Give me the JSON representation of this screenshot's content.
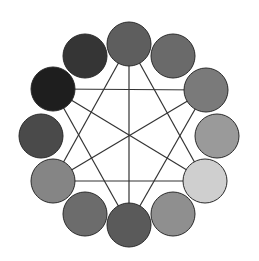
{
  "diagram": {
    "type": "color-wheel-grayscale",
    "width": 259,
    "height": 261,
    "center": [
      129,
      134
    ],
    "circle_radius": 22,
    "circle_stroke": "#2a2a2a",
    "line_color": "#333333",
    "nodes": [
      {
        "id": "pos-12",
        "cx": 129,
        "cy": 44,
        "fill": "#5e5e5e"
      },
      {
        "id": "pos-1",
        "cx": 173,
        "cy": 56,
        "fill": "#6a6a6a"
      },
      {
        "id": "pos-2",
        "cx": 206,
        "cy": 90,
        "fill": "#7a7a7a"
      },
      {
        "id": "pos-3",
        "cx": 217,
        "cy": 136,
        "fill": "#9a9a9a"
      },
      {
        "id": "pos-4",
        "cx": 205,
        "cy": 181,
        "fill": "#cfcfcf"
      },
      {
        "id": "pos-5",
        "cx": 173,
        "cy": 214,
        "fill": "#8f8f8f"
      },
      {
        "id": "pos-6",
        "cx": 129,
        "cy": 225,
        "fill": "#5a5a5a"
      },
      {
        "id": "pos-7",
        "cx": 85,
        "cy": 214,
        "fill": "#6c6c6c"
      },
      {
        "id": "pos-8",
        "cx": 53,
        "cy": 181,
        "fill": "#858585"
      },
      {
        "id": "pos-9",
        "cx": 41,
        "cy": 136,
        "fill": "#4a4a4a"
      },
      {
        "id": "pos-10",
        "cx": 53,
        "cy": 89,
        "fill": "#1e1e1e"
      },
      {
        "id": "pos-11",
        "cx": 85,
        "cy": 56,
        "fill": "#353535"
      }
    ],
    "edges": [
      [
        "pos-12",
        "pos-6"
      ],
      [
        "pos-10",
        "pos-2"
      ],
      [
        "pos-8",
        "pos-4"
      ],
      [
        "pos-12",
        "pos-8"
      ],
      [
        "pos-12",
        "pos-4"
      ],
      [
        "pos-6",
        "pos-10"
      ],
      [
        "pos-6",
        "pos-2"
      ],
      [
        "pos-10",
        "pos-4"
      ],
      [
        "pos-2",
        "pos-8"
      ]
    ]
  }
}
